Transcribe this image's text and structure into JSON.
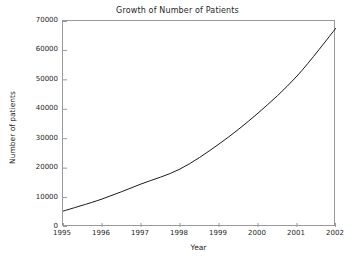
{
  "chart_data": {
    "type": "line",
    "title": "Growth of Number of Patients",
    "xlabel": "Year",
    "ylabel": "Number of patients",
    "xlim": [
      1995,
      2002
    ],
    "ylim": [
      0,
      70000
    ],
    "xticks": [
      1995,
      1996,
      1997,
      1998,
      1999,
      2000,
      2001,
      2002
    ],
    "xtick_labels": [
      "1995",
      "1996",
      "1997",
      "1998",
      "1999",
      "2000",
      "2001",
      "2002"
    ],
    "yticks": [
      0,
      10000,
      20000,
      30000,
      40000,
      50000,
      60000,
      70000
    ],
    "ytick_labels": [
      "0",
      "10000",
      "20000",
      "30000",
      "40000",
      "50000",
      "60000",
      "70000"
    ],
    "grid": false,
    "legend": false,
    "tick_direction": "in",
    "line_color": "#1a1a1a",
    "line_width": 1,
    "background_color": "#ffffff",
    "frame_color": "#9a9a9a",
    "x": [
      1995,
      1996,
      1997,
      1998,
      1999,
      2000,
      2001,
      2002
    ],
    "values": [
      5400,
      9500,
      14600,
      19700,
      28200,
      38700,
      51300,
      67600
    ],
    "series": [
      {
        "name": "Number of patients",
        "values": [
          5400,
          9500,
          14600,
          19700,
          28200,
          38700,
          51300,
          67600
        ]
      }
    ]
  }
}
